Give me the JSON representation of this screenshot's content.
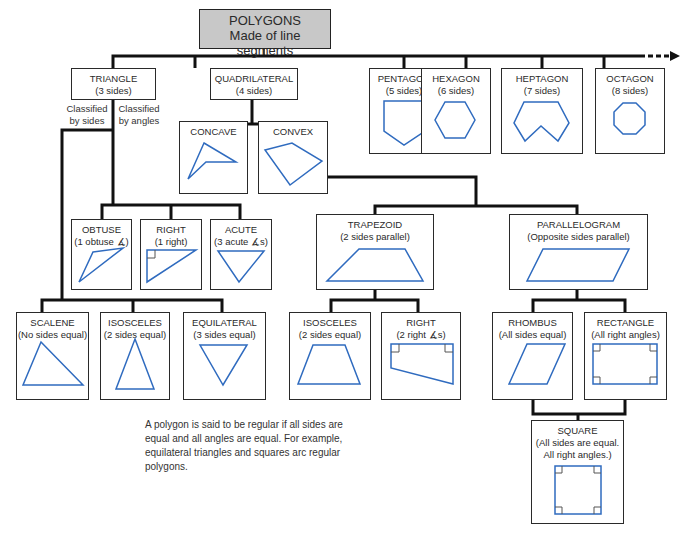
{
  "root": {
    "title": "POLYGONS",
    "subtitle": "Made of line segments"
  },
  "level1": [
    {
      "id": "triangle",
      "title": "TRIANGLE",
      "subtitle": "(3 sides)"
    },
    {
      "id": "quadrilateral",
      "title": "QUADRILATERAL",
      "subtitle": "(4 sides)"
    },
    {
      "id": "pentagon",
      "title": "PENTAGON",
      "subtitle": "(5 sides)"
    },
    {
      "id": "hexagon",
      "title": "HEXAGON",
      "subtitle": "(6 sides)"
    },
    {
      "id": "heptagon",
      "title": "HEPTAGON",
      "subtitle": "(7 sides)"
    },
    {
      "id": "octagon",
      "title": "OCTAGON",
      "subtitle": "(8 sides)"
    }
  ],
  "triangle_branches": {
    "by_sides": "Classified\nby sides",
    "by_angles": "Classified\nby angles",
    "by_sides_l1": "Classified",
    "by_sides_l2": "by sides",
    "by_angles_l1": "Classified",
    "by_angles_l2": "by angles"
  },
  "quad_children": [
    {
      "title": "CONCAVE"
    },
    {
      "title": "CONVEX"
    }
  ],
  "triangle_angles": [
    {
      "title": "OBTUSE",
      "subtitle": "(1 obtuse ∡)"
    },
    {
      "title": "RIGHT",
      "subtitle": "(1 right)"
    },
    {
      "title": "ACUTE",
      "subtitle": "(3 acute ∡s)"
    }
  ],
  "triangle_sides": [
    {
      "title": "SCALENE",
      "subtitle": "(No sides equal)"
    },
    {
      "title": "ISOSCELES",
      "subtitle": "(2 sides equal)"
    },
    {
      "title": "EQUILATERAL",
      "subtitle": "(3 sides equal)"
    }
  ],
  "convex_children": [
    {
      "title": "TRAPEZOID",
      "subtitle": "(2 sides parallel)"
    },
    {
      "title": "PARALLELOGRAM",
      "subtitle": "(Opposite sides parallel)"
    }
  ],
  "trapezoid_children": [
    {
      "title": "ISOSCELES",
      "subtitle": "(2 sides equal)"
    },
    {
      "title": "RIGHT",
      "subtitle": "(2 right ∡s)"
    }
  ],
  "parallelogram_children": [
    {
      "title": "RHOMBUS",
      "subtitle": "(All sides equal)"
    },
    {
      "title": "RECTANGLE",
      "subtitle": "(All right angles)"
    }
  ],
  "square": {
    "title": "SQUARE",
    "subtitle_l1": "(All sides are equal.",
    "subtitle_l2": "All right angles.)"
  },
  "note": "A polygon is said to be regular if all sides are equal and all angles are equal. For example, equilateral triangles and squares arc regular polygons.",
  "colors": {
    "shape_stroke": "#2f6bbf",
    "line": "#111111",
    "root_fill": "#c8c8c8"
  }
}
